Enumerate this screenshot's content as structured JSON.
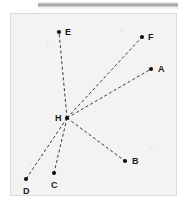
{
  "figure": {
    "background_color": "#f4f3f1",
    "border_color": "#dcdad6",
    "line_color": "#3a3a3a",
    "point_color": "#101010",
    "label_color": "#1a1a1a",
    "line_style": "dashed",
    "center_point": "H",
    "width": 167,
    "height": 183,
    "points": [
      {
        "label": "A",
        "x": 140,
        "y": 55,
        "label_x": 147,
        "label_y": 51
      },
      {
        "label": "B",
        "x": 114,
        "y": 147,
        "label_x": 121,
        "label_y": 143
      },
      {
        "label": "C",
        "x": 43,
        "y": 159,
        "label_x": 40,
        "label_y": 167
      },
      {
        "label": "D",
        "x": 15,
        "y": 165,
        "label_x": 12,
        "label_y": 173
      },
      {
        "label": "E",
        "x": 48,
        "y": 18,
        "label_x": 54,
        "label_y": 14
      },
      {
        "label": "F",
        "x": 131,
        "y": 23,
        "label_x": 137,
        "label_y": 19
      },
      {
        "label": "H",
        "x": 56,
        "y": 104,
        "label_x": 44,
        "label_y": 100
      }
    ],
    "rays": [
      {
        "from": "H",
        "to": "A"
      },
      {
        "from": "H",
        "to": "B"
      },
      {
        "from": "H",
        "to": "C"
      },
      {
        "from": "H",
        "to": "D"
      },
      {
        "from": "H",
        "to": "E"
      },
      {
        "from": "H",
        "to": "F"
      }
    ]
  },
  "top_bar": {
    "name": "scan-header-bar",
    "color": "#9d9d9d"
  }
}
